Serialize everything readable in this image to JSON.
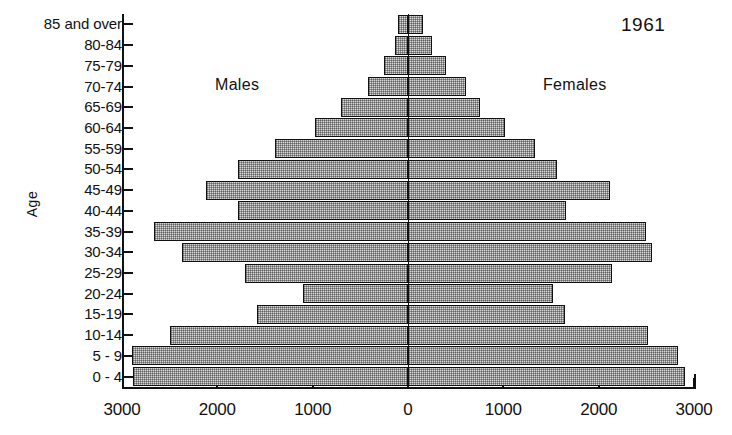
{
  "chart_data": {
    "type": "bar",
    "subtype": "population-pyramid",
    "title": "",
    "year": "1961",
    "xlabel": "",
    "ylabel": "Age",
    "left_series_label": "Males",
    "right_series_label": "Females",
    "xlim": [
      3000,
      0,
      3000
    ],
    "xticks": [
      3000,
      2000,
      1000,
      0,
      1000,
      2000,
      3000
    ],
    "xtick_labels": [
      "3000",
      "2000",
      "1000",
      "0",
      "1000",
      "2000",
      "3000"
    ],
    "grid": false,
    "legend": "none",
    "categories": [
      "85 and over",
      "80-84",
      "75-79",
      "70-74",
      "65-69",
      "60-64",
      "55-59",
      "50-54",
      "45-49",
      "40-44",
      "35-39",
      "30-34",
      "25-29",
      "20-24",
      "15-19",
      "10-14",
      "5 - 9",
      "0 - 4"
    ],
    "series": [
      {
        "name": "Males",
        "values": [
          105,
          135,
          250,
          420,
          700,
          975,
          1395,
          1780,
          2120,
          1785,
          2665,
          2370,
          1710,
          1100,
          1585,
          2495,
          2895,
          2885
        ]
      },
      {
        "name": "Females",
        "values": [
          155,
          250,
          400,
          610,
          755,
          1020,
          1335,
          1560,
          2120,
          1660,
          2500,
          2560,
          2140,
          1520,
          1650,
          2520,
          2835,
          2905
        ]
      }
    ]
  },
  "axis": {
    "y_title": "Age",
    "y_tick_labels": [
      "85 and over",
      "80-84",
      "75-79",
      "70-74",
      "65-69",
      "60-64",
      "55-59",
      "50-54",
      "45-49",
      "40-44",
      "35-39",
      "30-34",
      "25-29",
      "20-24",
      "15-19",
      "10-14",
      "5 - 9",
      "0 - 4"
    ],
    "x_tick_labels": [
      "3000",
      "2000",
      "1000",
      "0",
      "1000",
      "2000",
      "3000"
    ]
  },
  "annotations": {
    "year": "1961",
    "males": "Males",
    "females": "Females"
  },
  "colors": {
    "bar_fill": "#d9d9d9",
    "bar_border": "#111111",
    "axis": "#111111",
    "background": "#ffffff"
  }
}
